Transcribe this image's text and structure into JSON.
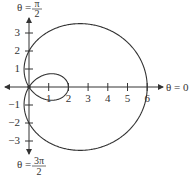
{
  "diagram": {
    "type": "polar-graph",
    "equation": "r = 2 + 4cos θ",
    "curve": "limaçon with inner loop",
    "labels": {
      "theta_top": "θ =",
      "theta_top_num": "π",
      "theta_top_den": "2",
      "theta_right": "θ = 0",
      "theta_bottom": "θ =",
      "theta_bottom_num": "3π",
      "theta_bottom_den": "2"
    },
    "x_ticks": [
      "1",
      "2",
      "3",
      "4",
      "5",
      "6"
    ],
    "y_ticks_pos": [
      "1",
      "2",
      "3"
    ],
    "y_ticks_neg": [
      "−1",
      "−2",
      "−3"
    ],
    "colors": {
      "stroke": "#333333",
      "background": "#ffffff"
    }
  },
  "chart_data": {
    "type": "line",
    "title": "",
    "equation": "r = 2 + 4cos(theta)",
    "x_ticks": [
      1,
      2,
      3,
      4,
      5,
      6
    ],
    "y_ticks": [
      -3,
      -2,
      -1,
      1,
      2,
      3
    ],
    "key_points": {
      "max_r_at_theta_0": 6,
      "inner_loop_x_intercept": 2,
      "y_intercepts": [
        2,
        -2
      ]
    },
    "xlabel": "θ = 0",
    "ylabel": "θ = π/2",
    "grid": false
  }
}
